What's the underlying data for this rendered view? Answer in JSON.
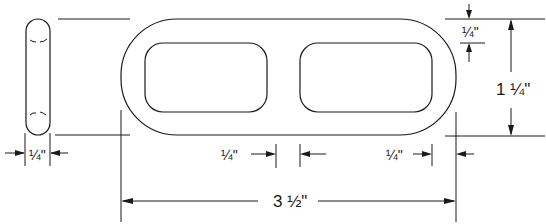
{
  "figure": {
    "type": "technical-drawing",
    "colors": {
      "ink": "#1a1a1a",
      "background": "#ffffff"
    }
  },
  "views": {
    "side_view": {
      "name": "side view (edge)"
    },
    "front_view": {
      "name": "front view (two openings)"
    }
  },
  "dimensions": {
    "side_thickness": "1/4\"",
    "top_rim": "1/4\"",
    "overall_height": "1 1/4\"",
    "center_bar": "1/4\"",
    "right_rim": "1/4\"",
    "overall_length": "3 1/2\""
  },
  "labels": {
    "side_thickness": "¼\"",
    "top_rim": "¼\"",
    "overall_height": "1 ¼\"",
    "center_bar": "¼\"",
    "right_rim": "¼\"",
    "overall_length": "3 ½\""
  }
}
